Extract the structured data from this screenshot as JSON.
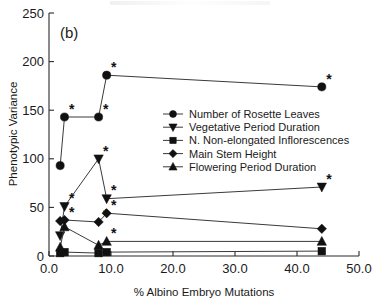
{
  "panel_label": "(b)",
  "chart_data": {
    "type": "scatter",
    "title": "",
    "xlabel": "% Albino Embryo Mutations",
    "ylabel": "Phenotypic Variance",
    "xlim": [
      0.0,
      50.0
    ],
    "ylim": [
      0,
      250
    ],
    "xticks": [
      "0.0",
      "10.0",
      "20.0",
      "30.0",
      "40.0",
      "50.0"
    ],
    "xtick_values": [
      0,
      10,
      20,
      30,
      40,
      50
    ],
    "yticks": [
      "0",
      "50",
      "100",
      "150",
      "200",
      "250"
    ],
    "ytick_values": [
      0,
      50,
      100,
      150,
      200,
      250
    ],
    "grid": false,
    "legend_position": "center-right",
    "annotation_marker": "*",
    "annotation_meaning": "significant",
    "x": [
      1.8,
      2.5,
      8.0,
      9.3,
      44.0
    ],
    "series": [
      {
        "name": "Number of Rosette Leaves",
        "marker": "circle",
        "x": [
          1.8,
          2.5,
          8.0,
          9.3,
          44.0
        ],
        "values": [
          93,
          143,
          143,
          186,
          174
        ],
        "significant": [
          false,
          true,
          true,
          true,
          true
        ]
      },
      {
        "name": "Vegetative Period Duration",
        "marker": "triangle-down",
        "x": [
          1.8,
          2.5,
          8.0,
          9.3,
          44.0
        ],
        "values": [
          21,
          51,
          100,
          59,
          71
        ],
        "significant": [
          false,
          true,
          true,
          true,
          true
        ]
      },
      {
        "name": "N. Non-elongated Inflorescences",
        "marker": "square",
        "x": [
          1.8,
          2.5,
          8.0,
          9.3,
          44.0
        ],
        "values": [
          3,
          4,
          3,
          4,
          5
        ],
        "significant": [
          false,
          false,
          false,
          false,
          false
        ]
      },
      {
        "name": "Main Stem Height",
        "marker": "diamond",
        "x": [
          1.8,
          2.5,
          8.0,
          9.3,
          44.0
        ],
        "values": [
          36,
          37,
          35,
          44,
          28
        ],
        "significant": [
          false,
          true,
          true,
          true,
          false
        ]
      },
      {
        "name": "Flowering Period Duration",
        "marker": "triangle-up",
        "x": [
          1.8,
          2.5,
          8.0,
          9.3,
          44.0
        ],
        "values": [
          9,
          30,
          11,
          15,
          15
        ],
        "significant": [
          false,
          false,
          false,
          true,
          false
        ]
      }
    ],
    "legend": [
      "Number of Rosette Leaves",
      "Vegetative Period Duration",
      "N. Non-elongated Inflorescences",
      "Main Stem Height",
      "Flowering Period Duration"
    ]
  }
}
